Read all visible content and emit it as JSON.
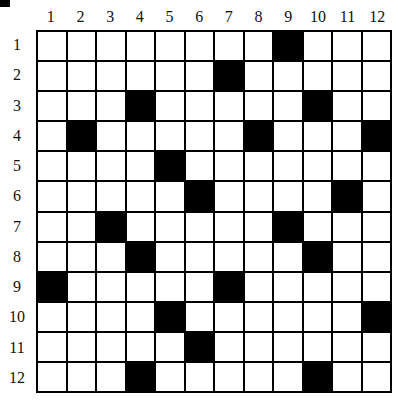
{
  "puzzle": {
    "rows": 12,
    "cols": 12,
    "col_labels": [
      "1",
      "2",
      "3",
      "4",
      "5",
      "6",
      "7",
      "8",
      "9",
      "10",
      "11",
      "12"
    ],
    "row_labels": [
      "1",
      "2",
      "3",
      "4",
      "5",
      "6",
      "7",
      "8",
      "9",
      "10",
      "11",
      "12"
    ],
    "black_cells": [
      [
        1,
        9
      ],
      [
        2,
        7
      ],
      [
        3,
        4
      ],
      [
        3,
        10
      ],
      [
        4,
        2
      ],
      [
        4,
        8
      ],
      [
        4,
        12
      ],
      [
        5,
        5
      ],
      [
        6,
        6
      ],
      [
        6,
        11
      ],
      [
        7,
        3
      ],
      [
        7,
        9
      ],
      [
        8,
        4
      ],
      [
        8,
        10
      ],
      [
        9,
        1
      ],
      [
        9,
        7
      ],
      [
        10,
        5
      ],
      [
        10,
        12
      ],
      [
        11,
        6
      ],
      [
        12,
        4
      ],
      [
        12,
        10
      ]
    ],
    "colors": {
      "black": "#000000",
      "white": "#ffffff"
    }
  }
}
